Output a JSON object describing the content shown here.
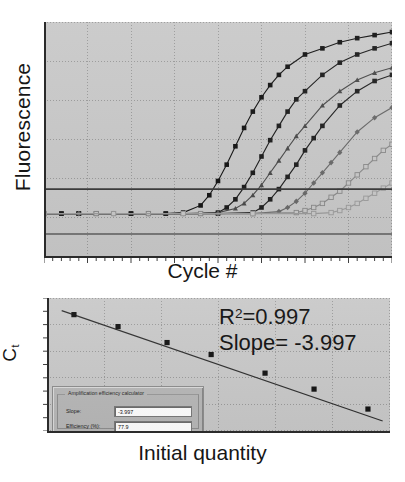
{
  "figure": {
    "panels": [
      "amplification-plot",
      "standard-curve-plot"
    ]
  },
  "amplification": {
    "ylabel": "Fluorescence",
    "xlabel": "Cycle #"
  },
  "standard_curve": {
    "ylabel_main": "C",
    "ylabel_sub": "t",
    "xlabel": "Initial quantity",
    "r2_prefix": "R",
    "r2_exp": "2",
    "r2_value": "=0.997",
    "slope_text": "Slope= -3.997"
  },
  "dialog": {
    "group_title": "Amplification efficiency calculator",
    "slope_label": "Slope:",
    "slope_value": "-3.997",
    "efficiency_label": "Efficiency (%):",
    "efficiency_value": "77.9"
  },
  "colors": {
    "plot_background": "#c9c9c9",
    "grid": "#9a9a9a",
    "axis": "#2b2b2b",
    "threshold": "#3a3a3a",
    "dialog_face": "#b8b8b8"
  },
  "chart_data": [
    {
      "type": "line",
      "title": "qPCR amplification curves",
      "xlabel": "Cycle #",
      "ylabel": "Fluorescence",
      "xlim": [
        0,
        40
      ],
      "ylim": [
        0,
        1
      ],
      "grid": true,
      "legend": "none",
      "threshold": 0.22,
      "annotations": [
        "threshold line"
      ],
      "series": [
        {
          "name": "standard 1 (highest copy number)",
          "marker": "filled-square",
          "color": "#141414",
          "x": [
            0,
            2,
            4,
            6,
            8,
            10,
            12,
            14,
            16,
            18,
            19,
            20,
            21,
            22,
            23,
            24,
            25,
            26,
            27,
            28,
            30,
            32,
            34,
            36,
            38,
            40
          ],
          "y": [
            0.1,
            0.1,
            0.1,
            0.1,
            0.1,
            0.1,
            0.1,
            0.1,
            0.105,
            0.14,
            0.19,
            0.26,
            0.34,
            0.43,
            0.52,
            0.6,
            0.67,
            0.73,
            0.78,
            0.82,
            0.88,
            0.91,
            0.94,
            0.96,
            0.975,
            0.99
          ]
        },
        {
          "name": "standard 2",
          "marker": "filled-square",
          "color": "#1c1c1c",
          "x": [
            0,
            2,
            4,
            6,
            8,
            10,
            12,
            14,
            16,
            18,
            20,
            21,
            22,
            23,
            24,
            25,
            26,
            27,
            28,
            29,
            30,
            32,
            34,
            36,
            38,
            40
          ],
          "y": [
            0.1,
            0.1,
            0.1,
            0.1,
            0.1,
            0.1,
            0.1,
            0.1,
            0.1,
            0.1,
            0.105,
            0.13,
            0.17,
            0.23,
            0.3,
            0.38,
            0.46,
            0.53,
            0.6,
            0.66,
            0.7,
            0.78,
            0.84,
            0.88,
            0.91,
            0.935
          ]
        },
        {
          "name": "standard 3",
          "marker": "filled-triangle",
          "color": "#4a4a4a",
          "x": [
            0,
            4,
            8,
            12,
            16,
            20,
            22,
            23,
            24,
            25,
            26,
            27,
            28,
            29,
            30,
            32,
            34,
            36,
            38,
            40
          ],
          "y": [
            0.1,
            0.1,
            0.1,
            0.1,
            0.1,
            0.105,
            0.125,
            0.15,
            0.19,
            0.24,
            0.3,
            0.36,
            0.42,
            0.48,
            0.53,
            0.63,
            0.7,
            0.755,
            0.79,
            0.815
          ]
        },
        {
          "name": "standard 4",
          "marker": "filled-square",
          "color": "#202020",
          "x": [
            0,
            4,
            8,
            12,
            16,
            20,
            24,
            25,
            26,
            27,
            28,
            29,
            30,
            31,
            32,
            34,
            36,
            38,
            40
          ],
          "y": [
            0.1,
            0.1,
            0.1,
            0.1,
            0.1,
            0.1,
            0.105,
            0.13,
            0.17,
            0.22,
            0.28,
            0.34,
            0.41,
            0.47,
            0.53,
            0.63,
            0.7,
            0.75,
            0.78
          ]
        },
        {
          "name": "standard 5",
          "marker": "filled-diamond",
          "color": "#6a6a6a",
          "x": [
            0,
            4,
            8,
            12,
            16,
            20,
            24,
            27,
            28,
            29,
            30,
            31,
            32,
            33,
            34,
            36,
            38,
            40
          ],
          "y": [
            0.1,
            0.1,
            0.1,
            0.1,
            0.1,
            0.1,
            0.1,
            0.11,
            0.13,
            0.16,
            0.2,
            0.25,
            0.3,
            0.35,
            0.4,
            0.5,
            0.57,
            0.62
          ]
        },
        {
          "name": "standard 6",
          "marker": "open-square",
          "color": "#8a8a8a",
          "x": [
            0,
            6,
            12,
            18,
            24,
            29,
            30,
            31,
            32,
            33,
            34,
            35,
            36,
            37,
            38,
            39,
            40
          ],
          "y": [
            0.1,
            0.1,
            0.1,
            0.1,
            0.1,
            0.105,
            0.115,
            0.13,
            0.15,
            0.18,
            0.21,
            0.25,
            0.29,
            0.33,
            0.37,
            0.41,
            0.44
          ]
        },
        {
          "name": "standard 7 (lowest copy number)",
          "marker": "open-square",
          "color": "#9c9c9c",
          "x": [
            0,
            8,
            16,
            24,
            31,
            33,
            34,
            35,
            36,
            37,
            38,
            39,
            40
          ],
          "y": [
            0.1,
            0.1,
            0.1,
            0.1,
            0.1,
            0.105,
            0.115,
            0.13,
            0.15,
            0.175,
            0.2,
            0.225,
            0.25
          ]
        }
      ]
    },
    {
      "type": "scatter",
      "title": "Standard curve",
      "xlabel": "Initial quantity",
      "ylabel": "Ct",
      "xlim": [
        0,
        7
      ],
      "ylim": [
        0,
        1
      ],
      "grid": true,
      "legend": "none",
      "r_squared": 0.997,
      "slope": -3.997,
      "efficiency_percent": 77.9,
      "fit_line": {
        "type": "linear",
        "x": [
          0.3,
          6.85
        ],
        "y": [
          0.905,
          0.075
        ]
      },
      "points": {
        "x": [
          0.55,
          1.45,
          2.45,
          3.35,
          4.45,
          5.45,
          6.55
        ],
        "y": [
          0.875,
          0.785,
          0.665,
          0.575,
          0.435,
          0.315,
          0.165
        ]
      }
    }
  ]
}
